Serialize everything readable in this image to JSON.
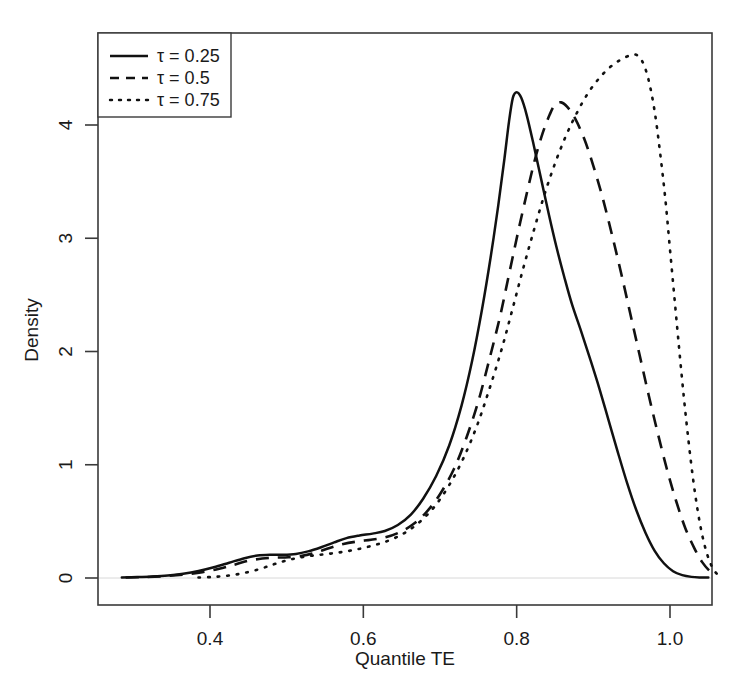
{
  "chart_data": {
    "type": "line",
    "title": "",
    "xlabel": "Quantile TE",
    "ylabel": "Density",
    "xlim": [
      0.27,
      1.06
    ],
    "ylim": [
      -0.08,
      4.8
    ],
    "xticks": [
      "0.4",
      "0.6",
      "0.8",
      "1.0"
    ],
    "xtick_values": [
      0.4,
      0.6,
      0.8,
      1.0
    ],
    "yticks": [
      "0",
      "1",
      "2",
      "3",
      "4"
    ],
    "ytick_values": [
      0,
      1,
      2,
      3,
      4
    ],
    "grid": false,
    "legend_position": "top-left",
    "series": [
      {
        "name": "tau = 0.25",
        "style": "solid",
        "color": "#111111",
        "peak_x": 0.795,
        "peak_y": 4.29,
        "points": [
          [
            0.285,
            0.005
          ],
          [
            0.305,
            0.008
          ],
          [
            0.325,
            0.013
          ],
          [
            0.345,
            0.022
          ],
          [
            0.365,
            0.038
          ],
          [
            0.385,
            0.062
          ],
          [
            0.405,
            0.095
          ],
          [
            0.425,
            0.135
          ],
          [
            0.445,
            0.175
          ],
          [
            0.462,
            0.199
          ],
          [
            0.478,
            0.206
          ],
          [
            0.495,
            0.205
          ],
          [
            0.512,
            0.212
          ],
          [
            0.528,
            0.235
          ],
          [
            0.545,
            0.272
          ],
          [
            0.562,
            0.315
          ],
          [
            0.578,
            0.352
          ],
          [
            0.595,
            0.375
          ],
          [
            0.612,
            0.392
          ],
          [
            0.628,
            0.415
          ],
          [
            0.645,
            0.468
          ],
          [
            0.662,
            0.56
          ],
          [
            0.678,
            0.7
          ],
          [
            0.695,
            0.9
          ],
          [
            0.712,
            1.17
          ],
          [
            0.728,
            1.52
          ],
          [
            0.742,
            1.92
          ],
          [
            0.755,
            2.38
          ],
          [
            0.766,
            2.83
          ],
          [
            0.776,
            3.29
          ],
          [
            0.784,
            3.7
          ],
          [
            0.79,
            4.03
          ],
          [
            0.795,
            4.24
          ],
          [
            0.8,
            4.29
          ],
          [
            0.806,
            4.24
          ],
          [
            0.813,
            4.09
          ],
          [
            0.822,
            3.83
          ],
          [
            0.832,
            3.52
          ],
          [
            0.842,
            3.21
          ],
          [
            0.852,
            2.92
          ],
          [
            0.862,
            2.66
          ],
          [
            0.872,
            2.42
          ],
          [
            0.884,
            2.18
          ],
          [
            0.896,
            1.93
          ],
          [
            0.908,
            1.67
          ],
          [
            0.92,
            1.39
          ],
          [
            0.932,
            1.11
          ],
          [
            0.944,
            0.84
          ],
          [
            0.956,
            0.6
          ],
          [
            0.968,
            0.4
          ],
          [
            0.98,
            0.24
          ],
          [
            0.992,
            0.13
          ],
          [
            1.004,
            0.06
          ],
          [
            1.016,
            0.025
          ],
          [
            1.028,
            0.01
          ],
          [
            1.04,
            0.005
          ],
          [
            1.05,
            0.004
          ]
        ]
      },
      {
        "name": "tau = 0.5",
        "style": "dashed",
        "color": "#111111",
        "peak_x": 0.855,
        "peak_y": 4.2,
        "points": [
          [
            0.29,
            0.004
          ],
          [
            0.315,
            0.008
          ],
          [
            0.34,
            0.016
          ],
          [
            0.365,
            0.03
          ],
          [
            0.39,
            0.052
          ],
          [
            0.412,
            0.082
          ],
          [
            0.432,
            0.118
          ],
          [
            0.45,
            0.152
          ],
          [
            0.468,
            0.172
          ],
          [
            0.485,
            0.18
          ],
          [
            0.502,
            0.183
          ],
          [
            0.52,
            0.196
          ],
          [
            0.538,
            0.225
          ],
          [
            0.556,
            0.265
          ],
          [
            0.574,
            0.3
          ],
          [
            0.592,
            0.322
          ],
          [
            0.61,
            0.338
          ],
          [
            0.628,
            0.358
          ],
          [
            0.646,
            0.4
          ],
          [
            0.664,
            0.47
          ],
          [
            0.682,
            0.58
          ],
          [
            0.7,
            0.74
          ],
          [
            0.718,
            0.96
          ],
          [
            0.734,
            1.23
          ],
          [
            0.75,
            1.56
          ],
          [
            0.764,
            1.92
          ],
          [
            0.778,
            2.3
          ],
          [
            0.79,
            2.68
          ],
          [
            0.802,
            3.06
          ],
          [
            0.814,
            3.42
          ],
          [
            0.824,
            3.7
          ],
          [
            0.834,
            3.93
          ],
          [
            0.843,
            4.09
          ],
          [
            0.85,
            4.18
          ],
          [
            0.858,
            4.2
          ],
          [
            0.866,
            4.16
          ],
          [
            0.876,
            4.06
          ],
          [
            0.888,
            3.88
          ],
          [
            0.9,
            3.64
          ],
          [
            0.912,
            3.36
          ],
          [
            0.924,
            3.04
          ],
          [
            0.936,
            2.7
          ],
          [
            0.948,
            2.34
          ],
          [
            0.96,
            1.98
          ],
          [
            0.972,
            1.62
          ],
          [
            0.984,
            1.28
          ],
          [
            0.996,
            0.96
          ],
          [
            1.008,
            0.68
          ],
          [
            1.02,
            0.44
          ],
          [
            1.032,
            0.26
          ],
          [
            1.042,
            0.14
          ],
          [
            1.052,
            0.06
          ],
          [
            1.06,
            0.02
          ]
        ]
      },
      {
        "name": "tau = 0.75",
        "style": "dotted",
        "color": "#111111",
        "peak_x": 0.955,
        "peak_y": 4.62,
        "points": [
          [
            0.385,
            0.004
          ],
          [
            0.405,
            0.01
          ],
          [
            0.425,
            0.022
          ],
          [
            0.445,
            0.045
          ],
          [
            0.465,
            0.08
          ],
          [
            0.482,
            0.118
          ],
          [
            0.498,
            0.152
          ],
          [
            0.515,
            0.178
          ],
          [
            0.532,
            0.196
          ],
          [
            0.55,
            0.21
          ],
          [
            0.568,
            0.225
          ],
          [
            0.586,
            0.245
          ],
          [
            0.604,
            0.272
          ],
          [
            0.622,
            0.305
          ],
          [
            0.64,
            0.35
          ],
          [
            0.658,
            0.415
          ],
          [
            0.676,
            0.51
          ],
          [
            0.694,
            0.64
          ],
          [
            0.712,
            0.82
          ],
          [
            0.73,
            1.05
          ],
          [
            0.748,
            1.34
          ],
          [
            0.764,
            1.66
          ],
          [
            0.78,
            2.01
          ],
          [
            0.794,
            2.36
          ],
          [
            0.808,
            2.72
          ],
          [
            0.822,
            3.06
          ],
          [
            0.836,
            3.38
          ],
          [
            0.85,
            3.66
          ],
          [
            0.864,
            3.9
          ],
          [
            0.878,
            4.1
          ],
          [
            0.892,
            4.27
          ],
          [
            0.906,
            4.4
          ],
          [
            0.92,
            4.5
          ],
          [
            0.934,
            4.57
          ],
          [
            0.946,
            4.61
          ],
          [
            0.956,
            4.62
          ],
          [
            0.964,
            4.56
          ],
          [
            0.972,
            4.4
          ],
          [
            0.98,
            4.12
          ],
          [
            0.987,
            3.76
          ],
          [
            0.994,
            3.34
          ],
          [
            1.0,
            2.9
          ],
          [
            1.006,
            2.46
          ],
          [
            1.012,
            2.02
          ],
          [
            1.018,
            1.6
          ],
          [
            1.024,
            1.22
          ],
          [
            1.03,
            0.88
          ],
          [
            1.036,
            0.6
          ],
          [
            1.042,
            0.38
          ],
          [
            1.048,
            0.22
          ],
          [
            1.054,
            0.11
          ],
          [
            1.06,
            0.045
          ],
          [
            1.066,
            0.015
          ]
        ]
      }
    ]
  },
  "legend": {
    "entries": [
      {
        "label": "τ = 0.25",
        "style": "solid"
      },
      {
        "label": "τ = 0.5",
        "style": "dashed"
      },
      {
        "label": "τ = 0.75",
        "style": "dotted"
      }
    ]
  },
  "axes": {
    "x_label": "Quantile TE",
    "y_label": "Density",
    "x_tick_labels": [
      "0.4",
      "0.6",
      "0.8",
      "1.0"
    ],
    "y_tick_labels": [
      "0",
      "1",
      "2",
      "3",
      "4"
    ]
  },
  "style": {
    "line_color": "#111111",
    "axis_color": "#3a3a3a",
    "background": "#ffffff"
  }
}
